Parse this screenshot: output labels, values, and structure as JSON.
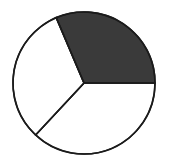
{
  "figure": {
    "background_color": "#ffffff",
    "width": 169,
    "height": 164
  },
  "chart_data": {
    "type": "pie",
    "title": "",
    "subtitle": "",
    "xlabel": "",
    "ylabel": "",
    "grid": false,
    "legend": "none",
    "total_slices": 3,
    "shaded_slices": 1,
    "fraction_shaded": "1/3",
    "fraction_shaded_decimal": 0.3333,
    "percent_shaded": "33.3%",
    "slice_angle_degrees": 120,
    "categories": [
      "Shaded sector",
      "Unshaded sector 1",
      "Unshaded sector 2"
    ],
    "values": [
      1,
      1,
      1
    ],
    "percentages": [
      33.3,
      33.3,
      33.3
    ],
    "slices": [
      {
        "label": "Shaded sector",
        "value": 1,
        "percent": 33.3,
        "fill_color": "#3a3a3a",
        "stroke_color": "#1b1b1b",
        "start_angle_degrees": 0,
        "end_angle_degrees": 113,
        "position": "upper-right"
      },
      {
        "label": "Unshaded sector 1",
        "value": 1,
        "percent": 33.3,
        "fill_color": "#ffffff",
        "stroke_color": "#1b1b1b",
        "start_angle_degrees": 113,
        "end_angle_degrees": 227,
        "position": "left"
      },
      {
        "label": "Unshaded sector 2",
        "value": 1,
        "percent": 33.3,
        "fill_color": "#ffffff",
        "stroke_color": "#1b1b1b",
        "start_angle_degrees": 227,
        "end_angle_degrees": 360,
        "position": "lower-right"
      }
    ],
    "geometry": {
      "center_x": 84,
      "center_y": 83,
      "radius": 71,
      "outline_width": 1.6
    },
    "colors": {
      "shaded_fill": "#3a3a3a",
      "unshaded_fill": "#ffffff",
      "outline": "#1b1b1b",
      "background": "#ffffff"
    },
    "annotations": []
  }
}
